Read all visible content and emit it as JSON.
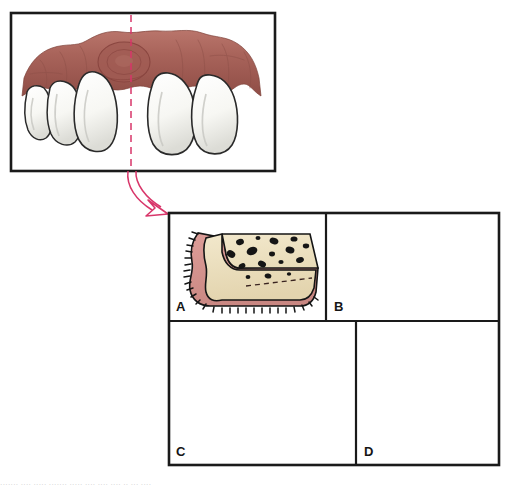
{
  "figure": {
    "kind": "medical-illustration",
    "palette": {
      "frame_stroke": "#1a1a1a",
      "background": "#ffffff",
      "gingiva_clinical": "#a8635a",
      "gingiva_clinical_shadow": "#8d4b45",
      "gingiva_clinical_highlight": "#c08279",
      "gingiva_section": "#d89490",
      "gingiva_section_shadow": "#c07e79",
      "bone_fill": "#ece0c0",
      "bone_shadow": "#d9c9a4",
      "trabecular_void": "#151515",
      "tooth_fill": "#fbfbf8",
      "tooth_shadow": "#d8d8d4",
      "tooth_stroke": "#2a2a2a",
      "section_line": "#d8366a",
      "arrow": "#d8366a",
      "outline": "#151515"
    }
  },
  "clinical_panel": {
    "name": "clinical-view",
    "description": "Facial view of maxillary anterior gingiva with localized swelling",
    "section_line": {
      "label": "section-plane",
      "style": "dashed-vertical",
      "x_fraction": 0.47
    },
    "lesion": {
      "label": "gingival-swelling",
      "shape": "rounded-nodule"
    },
    "teeth": [
      {
        "name": "tooth-left-3",
        "type": "incisor"
      },
      {
        "name": "tooth-left-2",
        "type": "incisor"
      },
      {
        "name": "tooth-left-1",
        "type": "central-incisor"
      },
      {
        "name": "tooth-right-1",
        "type": "central-incisor"
      },
      {
        "name": "tooth-right-2",
        "type": "central-incisor"
      }
    ]
  },
  "arrow": {
    "name": "section-arrow",
    "description": "Curved arrow linking section plane to cross-section panels"
  },
  "section_panels": [
    {
      "id": "A",
      "label": "A",
      "name": "cross-section-a",
      "description": "Broad ridge, thick gingiva following bone contour, dashed original bone margin"
    },
    {
      "id": "B",
      "label": "B",
      "name": "cross-section-b",
      "description": "Narrow ridge with reduced bone width, dashed original bone margin"
    },
    {
      "id": "C",
      "label": "C",
      "name": "cross-section-c",
      "description": "Elongated pendulous soft tissue flap extending well beyond the bone crest"
    },
    {
      "id": "D",
      "label": "D",
      "name": "cross-section-d",
      "description": "Bulbous rounded gingival fold overlying the crest"
    }
  ],
  "caption": {
    "name": "page-caption",
    "text": "·······  ····  ·····  ·······   ····· ····  ···· ····  ·· ···  ····"
  }
}
